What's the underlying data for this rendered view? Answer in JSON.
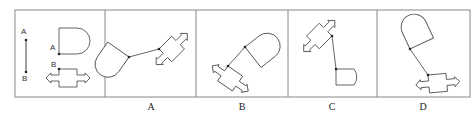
{
  "puzzle": {
    "reference": {
      "labels": {
        "a_top": "A",
        "b_bottom": "B",
        "a_shape": "A",
        "b_shape": "B"
      }
    },
    "options": [
      {
        "label": "A"
      },
      {
        "label": "B"
      },
      {
        "label": "C"
      },
      {
        "label": "D"
      }
    ]
  },
  "colors": {
    "stroke": "#555555",
    "border": "#888888",
    "dot": "#222222"
  }
}
